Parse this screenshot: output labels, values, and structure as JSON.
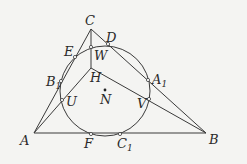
{
  "diagram": {
    "colors": {
      "stroke": "#3a3a3a",
      "background": "#f4f4f2",
      "point_fill": "#ffffff"
    },
    "circle": {
      "center": "N",
      "cx": 105,
      "cy": 91,
      "r": 45
    },
    "points": {
      "A": {
        "x": 34,
        "y": 133,
        "label": "A"
      },
      "B": {
        "x": 206,
        "y": 133,
        "label": "B"
      },
      "C": {
        "x": 91,
        "y": 29,
        "label": "C"
      },
      "H": {
        "x": 91,
        "y": 68,
        "label": "H"
      },
      "D": {
        "x": 108,
        "y": 44,
        "label": "D"
      },
      "E": {
        "x": 75,
        "y": 57,
        "label": "E"
      },
      "F": {
        "x": 91,
        "y": 134,
        "label": "F"
      },
      "W": {
        "x": 91,
        "y": 47,
        "label": "W"
      },
      "U": {
        "x": 62,
        "y": 100,
        "label": "U"
      },
      "V": {
        "x": 149,
        "y": 99,
        "label": "V"
      },
      "A1": {
        "x": 148,
        "y": 80,
        "label": "A",
        "sub": "1"
      },
      "B1": {
        "x": 61,
        "y": 81,
        "label": "B",
        "sub": "1"
      },
      "C1": {
        "x": 120,
        "y": 134,
        "label": "C",
        "sub": "1"
      },
      "N": {
        "x": 105,
        "y": 90,
        "label": "N"
      }
    },
    "segments": [
      [
        "A",
        "B"
      ],
      [
        "B",
        "C"
      ],
      [
        "C",
        "A"
      ],
      [
        "C",
        "H"
      ],
      [
        "A",
        "H"
      ],
      [
        "B",
        "H"
      ],
      [
        "A",
        "D"
      ],
      [
        "B",
        "E"
      ]
    ]
  }
}
